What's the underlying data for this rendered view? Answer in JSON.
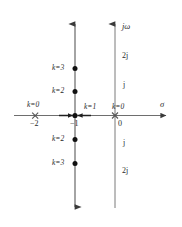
{
  "figure": {
    "type": "root-locus-s-plane",
    "axes": {
      "real_axis_label": "σ",
      "imag_axis_label": "jω"
    },
    "real_ticks": [
      {
        "label": "−2",
        "value": -2
      },
      {
        "label": "−1",
        "value": -1
      },
      {
        "label": "0",
        "value": 0
      }
    ],
    "imag_ticks": [
      {
        "label": "2j",
        "value": 2
      },
      {
        "label": "j",
        "value": 1
      },
      {
        "label": "j",
        "value": -1
      },
      {
        "label": "2j",
        "value": -2
      }
    ],
    "poles": [
      {
        "marker": "x",
        "real": -2,
        "imag": 0,
        "gain_label": "k=0"
      },
      {
        "marker": "x",
        "real": 0,
        "imag": 0,
        "gain_label": "k=0"
      }
    ],
    "gain_labels": [
      {
        "text": "k=0",
        "at": "-2"
      },
      {
        "text": "k=1",
        "at": "-1 to 0 midpoint"
      },
      {
        "text": "k=0",
        "at": "0"
      },
      {
        "text": "k=3",
        "at": "-1+2j"
      },
      {
        "text": "k=2",
        "at": "-1+j"
      },
      {
        "text": "k=2",
        "at": "-1-j"
      },
      {
        "text": "k=3",
        "at": "-1-2j"
      }
    ],
    "locus_points": [
      {
        "marker": "dot",
        "real": -1,
        "imag": 2,
        "gain_label": "k=3"
      },
      {
        "marker": "dot",
        "real": -1,
        "imag": 1,
        "gain_label": "k=2"
      },
      {
        "marker": "dot",
        "real": -1,
        "imag": -1,
        "gain_label": "k=2"
      },
      {
        "marker": "dot",
        "real": -1,
        "imag": -2,
        "gain_label": "k=3"
      },
      {
        "marker": "dot",
        "real": -1,
        "imag": 0,
        "gain_label": "k=1"
      }
    ],
    "breakaway_real": -1,
    "colors": {
      "line": "#6b6b6b",
      "marker": "#1a1a1a",
      "text": "#2a2a2a",
      "background": "#ffffff"
    }
  },
  "labels": {
    "k0_left": "k=0",
    "k1_mid": "k=1",
    "k0_origin": "k=0",
    "k3_upper": "k=3",
    "k2_upper": "k=2",
    "k2_lower": "k=2",
    "k3_lower": "k=3",
    "tick_minus2": "−2",
    "tick_minus1": "−1",
    "tick_zero": "0",
    "imag_2j_upper": "2j",
    "imag_j_upper": "j",
    "imag_j_lower": "j",
    "imag_2j_lower": "2j",
    "sigma": "σ",
    "jomega": "jω"
  }
}
